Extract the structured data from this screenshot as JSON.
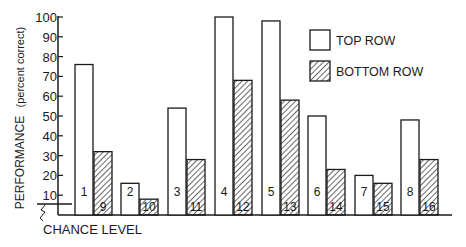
{
  "chart_data": {
    "type": "bar",
    "title": "",
    "xlabel": "",
    "ylabel": "PERFORMANCE (percent correct)",
    "ylim": [
      0,
      100
    ],
    "yticks": [
      10,
      20,
      30,
      40,
      50,
      60,
      70,
      80,
      90,
      100
    ],
    "grid": false,
    "legend_position": "upper right",
    "categories": [
      "1/9",
      "2/10",
      "3/11",
      "4/12",
      "5/13",
      "6/14",
      "7/15",
      "8/16"
    ],
    "series": [
      {
        "name": "TOP ROW",
        "pattern": "open",
        "bar_labels": [
          "1",
          "2",
          "3",
          "4",
          "5",
          "6",
          "7",
          "8"
        ],
        "values": [
          76,
          16,
          54,
          100,
          98,
          50,
          20,
          48
        ]
      },
      {
        "name": "BOTTOM ROW",
        "pattern": "hatched",
        "bar_labels": [
          "9",
          "10",
          "11",
          "12",
          "13",
          "14",
          "15",
          "16"
        ],
        "values": [
          32,
          8,
          28,
          68,
          58,
          23,
          16,
          28
        ]
      }
    ],
    "annotations": [
      {
        "text": "CHANCE LEVEL",
        "y": 5
      }
    ]
  },
  "labels": {
    "ylabel_main": "PERFORMANCE",
    "ylabel_sub": "(percent correct)",
    "chance": "CHANCE LEVEL",
    "legend_top": "TOP ROW",
    "legend_bottom": "BOTTOM ROW"
  },
  "colors": {
    "ink": "#1a1a1a",
    "background": "#ffffff"
  }
}
